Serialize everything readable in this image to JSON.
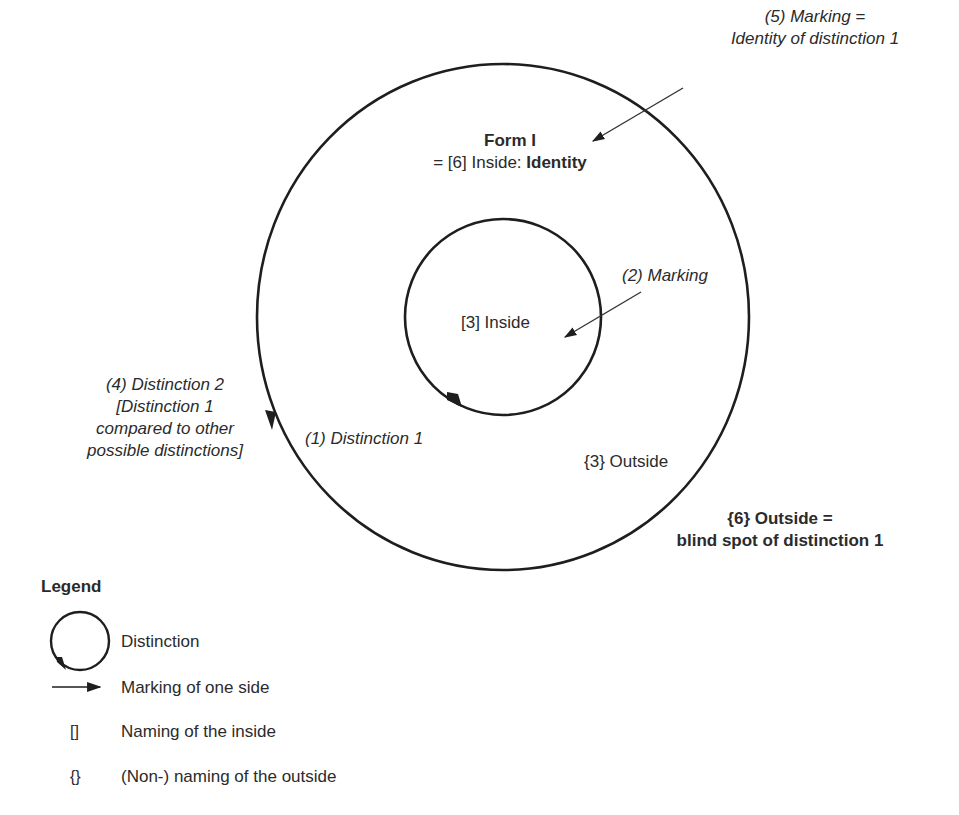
{
  "diagram": {
    "form_title": "Form I",
    "form_subtitle_prefix": "= [6] Inside: ",
    "form_subtitle_bold": "Identity",
    "label_marking_identity_line1": "(5) Marking =",
    "label_marking_identity_line2": "Identity of distinction 1",
    "label_marking": "(2) Marking",
    "label_inside": "[3] Inside",
    "label_distinction2_line1": "(4) Distinction 2",
    "label_distinction2_line2": "[Distinction 1",
    "label_distinction2_line3": "compared to other",
    "label_distinction2_line4": "possible distinctions]",
    "label_distinction1": "(1) Distinction 1",
    "label_outside": "{3} Outside",
    "label_blindspot_line1": "{6} Outside =",
    "label_blindspot_line2": "blind spot of distinction 1",
    "colors": {
      "stroke": "#1e1e1e",
      "text": "#2b2b2b",
      "background": "#ffffff"
    }
  },
  "legend": {
    "title": "Legend",
    "items": [
      {
        "symbol": "circle-arrow-icon",
        "label": "Distinction"
      },
      {
        "symbol": "arrow-right-icon",
        "label": "Marking of one side"
      },
      {
        "symbol": "[]",
        "label": "Naming of the inside"
      },
      {
        "symbol": "{}",
        "label": "(Non-) naming of the outside"
      }
    ]
  }
}
